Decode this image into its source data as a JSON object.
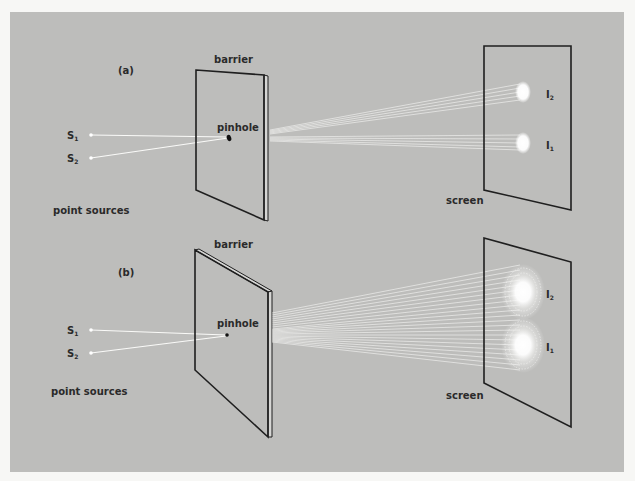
{
  "figure": {
    "background_color": "#bdbdbb",
    "page_color": "#f7f7f5",
    "line_color": "#1f1f1f",
    "light_color": "#ffffff"
  },
  "panel_a": {
    "tag": "(a)",
    "barrier_label": "barrier",
    "pinhole_label": "pinhole",
    "screen_label": "screen",
    "point_sources_label": "point sources",
    "sources": [
      {
        "label": "S",
        "subscript": "1"
      },
      {
        "label": "S",
        "subscript": "2"
      }
    ],
    "images": [
      {
        "label": "I",
        "subscript": "2"
      },
      {
        "label": "I",
        "subscript": "1"
      }
    ]
  },
  "panel_b": {
    "tag": "(b)",
    "barrier_label": "barrier",
    "pinhole_label": "pinhole",
    "screen_label": "screen",
    "point_sources_label": "point sources",
    "sources": [
      {
        "label": "S",
        "subscript": "1"
      },
      {
        "label": "S",
        "subscript": "2"
      }
    ],
    "images": [
      {
        "label": "I",
        "subscript": "2"
      },
      {
        "label": "I",
        "subscript": "1"
      }
    ]
  }
}
